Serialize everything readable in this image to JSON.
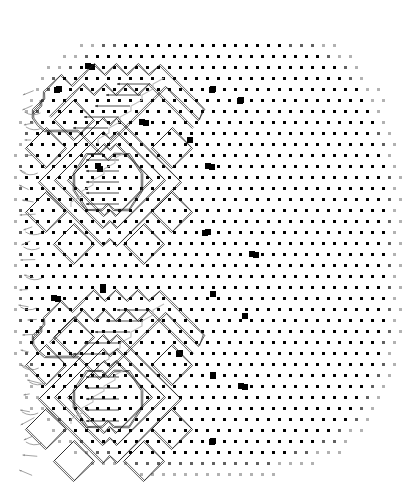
{
  "figure": {
    "kind": "scientific-diagram",
    "background_color": "#ffffff",
    "width": 410,
    "height": 498
  },
  "chart_data": {
    "type": "scatter",
    "title": "",
    "subtitle": "",
    "xlabel": "",
    "ylabel": "",
    "grid": false,
    "legend_position": "none",
    "xlim": [
      0,
      410
    ],
    "ylim": [
      0,
      498
    ],
    "lattice": {
      "marker_shape": "square",
      "marker_color": "#000000",
      "dot_size_px": 3,
      "defect_size_px": 6,
      "row_spacing_px": 11.0,
      "col_spacing_px": 11.0,
      "row_offset_px": 5.5,
      "origin_x_px": 15,
      "origin_y_px": 45,
      "rows": 41,
      "cols": 36,
      "corner_fade": true
    },
    "defects": [
      [
        88,
        66
      ],
      [
        57,
        90
      ],
      [
        212,
        90
      ],
      [
        240,
        101
      ],
      [
        190,
        140
      ],
      [
        212,
        167
      ],
      [
        205,
        233
      ],
      [
        256,
        255
      ],
      [
        213,
        294
      ],
      [
        245,
        316
      ],
      [
        179,
        354
      ],
      [
        213,
        376
      ],
      [
        245,
        387
      ],
      [
        212,
        442
      ],
      [
        103,
        290
      ],
      [
        58,
        299
      ],
      [
        146,
        123
      ],
      [
        100,
        169
      ]
    ],
    "series": [
      {
        "name": "lattice sites",
        "marker": "small-square",
        "count": 1300
      },
      {
        "name": "defect sites",
        "marker": "large-square",
        "count": 18
      }
    ],
    "motifs": [
      {
        "name": "upper-motif",
        "center_x": 108,
        "center_y": 182,
        "zigzag_top_y": 70,
        "hex_half_width": 34,
        "hex_half_height": 28,
        "arrow_count": 5,
        "diamond_rings": 3
      },
      {
        "name": "lower-motif",
        "center_x": 108,
        "center_y": 399,
        "zigzag_top_y": 296,
        "hex_half_width": 34,
        "hex_half_height": 28,
        "arrow_count": 5,
        "diamond_rings": 3
      }
    ],
    "contours": {
      "stroke_color": "#1a1a1a",
      "stroke_width_px": 0.7,
      "style": "double-line",
      "gap_px": 1.6
    },
    "arrows": {
      "stroke_color": "#222222",
      "faint_stroke_color": "#bdbdbd",
      "orientation": "horizontal-left",
      "head_size_px": 3
    },
    "edge_markers": {
      "name": "left-edge-displacement-tails",
      "color": "#8a8a8a",
      "count": 26,
      "x_range": [
        18,
        52
      ],
      "y_range": [
        95,
        470
      ]
    }
  }
}
